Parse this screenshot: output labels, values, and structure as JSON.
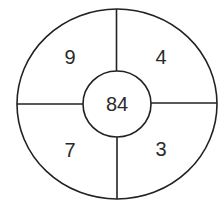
{
  "diagram": {
    "type": "circle-number-puzzle",
    "center_value": "84",
    "segments": [
      {
        "position": "top-left",
        "value": "9"
      },
      {
        "position": "top-right",
        "value": "4"
      },
      {
        "position": "bottom-left",
        "value": "7"
      },
      {
        "position": "bottom-right",
        "value": "3"
      }
    ],
    "colors": {
      "stroke": "#222222",
      "background": "#ffffff",
      "text": "#2a2a2a"
    }
  }
}
